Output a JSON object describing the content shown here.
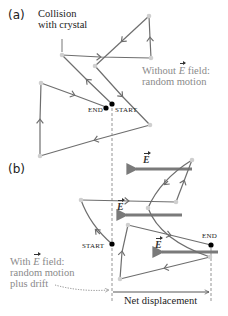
{
  "panel_a": {
    "label": "(a)",
    "callout": [
      "Collision",
      "with crystal"
    ],
    "start_label": "START",
    "end_label": "END",
    "caption_prefix": "Without ",
    "caption_field": "E",
    "caption_suffix": " field:",
    "caption_line2": "random motion"
  },
  "panel_b": {
    "label": "(b)",
    "start_label": "START",
    "end_label": "END",
    "field_label": "E",
    "caption_prefix": "With ",
    "caption_field": "E",
    "caption_suffix": " field:",
    "caption_line2": "random motion",
    "caption_line3": "plus drift",
    "net_displacement": "Net displacement"
  },
  "colors": {
    "path": "#6e6e6e",
    "field_arrow": "#7a7a7a",
    "collision_point": "#c8c8c8",
    "endpoint": "#000000",
    "gray_text": "#8a8a8a",
    "dashed": "#888888"
  }
}
